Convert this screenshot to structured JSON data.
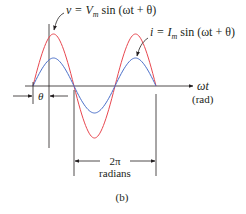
{
  "figure": {
    "caption": "(b)",
    "voltage_label": {
      "lhs": "v = V",
      "sub": "m",
      "rhs": " sin (ωt + θ)"
    },
    "current_label": {
      "lhs": "i = I",
      "sub": "m",
      "rhs": " sin (ωt + θ)"
    },
    "x_axis_label": "ωt",
    "x_axis_unit": "(rad)",
    "phase_label": "θ",
    "period_label": "2π",
    "period_unit": "radians",
    "colors": {
      "voltage": "#e8474f",
      "current": "#4a6fc9",
      "axis": "#231f20"
    }
  }
}
